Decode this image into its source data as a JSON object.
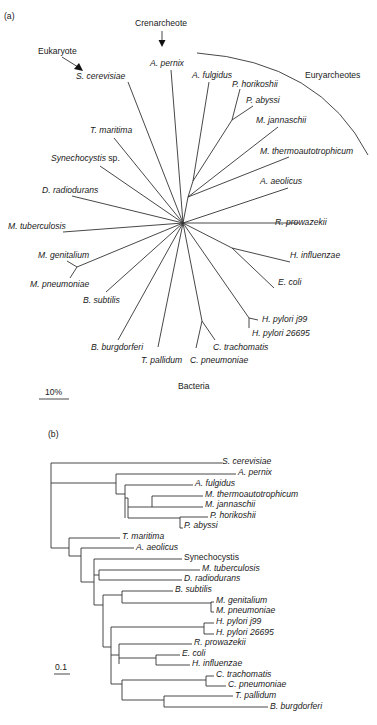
{
  "panel_a": {
    "label": "(a)",
    "center": [
      183,
      223
    ],
    "groups": {
      "eukaryote": "Eukaryote",
      "crenarcheote": "Crenarcheote",
      "euryarcheotes": "Euryarcheotes",
      "bacteria": "Bacteria"
    },
    "scale_bar": "10%",
    "nodes": [
      {
        "id": "arch",
        "x": 188,
        "y": 197,
        "from": "center"
      },
      {
        "id": "arch2",
        "x": 193,
        "y": 181,
        "from": "arch"
      },
      {
        "id": "pyro",
        "x": 232,
        "y": 120,
        "from": "arch2"
      },
      {
        "id": "myco",
        "x": 77,
        "y": 267,
        "from": "center"
      },
      {
        "id": "enter",
        "x": 232,
        "y": 248,
        "from": "center"
      },
      {
        "id": "hpy",
        "x": 249,
        "y": 318,
        "from": "center"
      },
      {
        "id": "chl",
        "x": 202,
        "y": 321,
        "from": "center"
      }
    ],
    "leaves": [
      {
        "name": "S. cerevisiae",
        "italic": true,
        "tx": 76,
        "ty": 79,
        "lx": 128,
        "ly": 82,
        "from": "center"
      },
      {
        "name": "A. pernix",
        "italic": true,
        "tx": 150,
        "ty": 66,
        "lx": 171,
        "ly": 70,
        "from": "center"
      },
      {
        "name": "A. fulgidus",
        "italic": true,
        "tx": 192,
        "ty": 78,
        "lx": 209,
        "ly": 82,
        "from": "arch2"
      },
      {
        "name": "P. horikoshii",
        "italic": true,
        "tx": 232,
        "ty": 87,
        "lx": 240,
        "ly": 89,
        "from": "pyro"
      },
      {
        "name": "P. abyssi",
        "italic": true,
        "tx": 246,
        "ty": 103,
        "lx": 253,
        "ly": 106,
        "from": "pyro"
      },
      {
        "name": "M. jannaschii",
        "italic": true,
        "tx": 256,
        "ty": 123,
        "lx": 278,
        "ly": 127,
        "from": "arch"
      },
      {
        "name": "M. thermoautotrophicum",
        "italic": true,
        "tx": 260,
        "ty": 154,
        "lx": 289,
        "ly": 157,
        "from": "arch"
      },
      {
        "name": "T. maritima",
        "italic": true,
        "tx": 90,
        "ty": 133,
        "lx": 114,
        "ly": 138,
        "from": "center"
      },
      {
        "name": "Synechocystis",
        "italic": true,
        "suffix": " sp.",
        "tx": 51,
        "ty": 161,
        "lx": 100,
        "ly": 166,
        "from": "center"
      },
      {
        "name": "D. radiodurans",
        "italic": true,
        "tx": 42,
        "ty": 193,
        "lx": 72,
        "ly": 196,
        "from": "center"
      },
      {
        "name": "A. aeolicus",
        "italic": true,
        "tx": 260,
        "ty": 184,
        "lx": 288,
        "ly": 188,
        "from": "center"
      },
      {
        "name": "M. tuberculosis",
        "italic": true,
        "tx": 8,
        "ty": 229,
        "lx": 63,
        "ly": 232,
        "from": "center"
      },
      {
        "name": "R. prowazekii",
        "italic": true,
        "tx": 275,
        "ty": 225,
        "lx": 299,
        "ly": 223,
        "from": "center"
      },
      {
        "name": "M. genitalium",
        "italic": true,
        "tx": 38,
        "ty": 258,
        "lx": 67,
        "ly": 261,
        "from": "myco"
      },
      {
        "name": "M. pneumoniae",
        "italic": true,
        "tx": 30,
        "ty": 287,
        "lx": 70,
        "ly": 278,
        "from": "myco"
      },
      {
        "name": "B. subtilis",
        "italic": true,
        "tx": 83,
        "ty": 303,
        "lx": 106,
        "ly": 292,
        "from": "center"
      },
      {
        "name": "H. influenzae",
        "italic": true,
        "tx": 290,
        "ty": 258,
        "lx": 290,
        "ly": 262,
        "from": "enter"
      },
      {
        "name": "E. coli",
        "italic": true,
        "tx": 278,
        "ty": 285,
        "lx": 274,
        "ly": 288,
        "from": "enter"
      },
      {
        "name": "H. pylori j99",
        "italic": true,
        "tx": 262,
        "ty": 322,
        "lx": 258,
        "ly": 320,
        "from": "hpy"
      },
      {
        "name": "H. pylori 26695",
        "italic": true,
        "tx": 252,
        "ty": 336,
        "lx": 249,
        "ly": 328,
        "from": "hpy"
      },
      {
        "name": "B. burgdorferi",
        "italic": true,
        "tx": 91,
        "ty": 350,
        "lx": 118,
        "ly": 340,
        "from": "center"
      },
      {
        "name": "T. pallidum",
        "italic": true,
        "tx": 141,
        "ty": 363,
        "lx": 158,
        "ly": 347,
        "from": "center"
      },
      {
        "name": "C. trachomatis",
        "italic": true,
        "tx": 213,
        "ty": 350,
        "lx": 215,
        "ly": 340,
        "from": "chl"
      },
      {
        "name": "C. pneumoniae",
        "italic": true,
        "tx": 190,
        "ty": 363,
        "lx": 196,
        "ly": 348,
        "from": "chl"
      }
    ]
  },
  "panel_b": {
    "label": "(b)",
    "scale_bar": "0.1",
    "leaves": [
      {
        "name": "S. cerevisiae",
        "italic": true,
        "x": 222,
        "y": 461
      },
      {
        "name": "A. pernix",
        "italic": true,
        "x": 238,
        "y": 472
      },
      {
        "name": "A. fulgidus",
        "italic": true,
        "x": 195,
        "y": 483
      },
      {
        "name": "M. thermoautotrophicum",
        "italic": true,
        "x": 205,
        "y": 494
      },
      {
        "name": "M. jannaschii",
        "italic": true,
        "x": 205,
        "y": 504
      },
      {
        "name": "P. horikoshii",
        "italic": true,
        "x": 210,
        "y": 515
      },
      {
        "name": "P. abyssi",
        "italic": true,
        "x": 184,
        "y": 525
      },
      {
        "name": "T. maritima",
        "italic": true,
        "x": 122,
        "y": 536
      },
      {
        "name": "A. aeolicus",
        "italic": true,
        "x": 136,
        "y": 547
      },
      {
        "name": "Synechocystis",
        "italic": false,
        "x": 184,
        "y": 557
      },
      {
        "name": "M. tuberculosis",
        "italic": true,
        "x": 202,
        "y": 568
      },
      {
        "name": "D. radiodurans",
        "italic": true,
        "x": 184,
        "y": 578
      },
      {
        "name": "B. subtilis",
        "italic": true,
        "x": 175,
        "y": 589
      },
      {
        "name": "M. genitalium",
        "italic": true,
        "x": 216,
        "y": 600
      },
      {
        "name": "M. pneumoniae",
        "italic": true,
        "x": 216,
        "y": 610
      },
      {
        "name": "H. pylori j99",
        "italic": true,
        "x": 216,
        "y": 621
      },
      {
        "name": "H. pylori 26695",
        "italic": true,
        "x": 216,
        "y": 632
      },
      {
        "name": "R. prowazekii",
        "italic": true,
        "x": 194,
        "y": 642
      },
      {
        "name": "E. coli",
        "italic": true,
        "x": 182,
        "y": 653
      },
      {
        "name": "H. influenzae",
        "italic": true,
        "x": 192,
        "y": 663
      },
      {
        "name": "C. trachomatis",
        "italic": true,
        "x": 216,
        "y": 674
      },
      {
        "name": "C. pneumoniae",
        "italic": true,
        "x": 228,
        "y": 684
      },
      {
        "name": "T. pallidum",
        "italic": true,
        "x": 235,
        "y": 695
      },
      {
        "name": "B. burgdorferi",
        "italic": true,
        "x": 270,
        "y": 706
      }
    ]
  }
}
